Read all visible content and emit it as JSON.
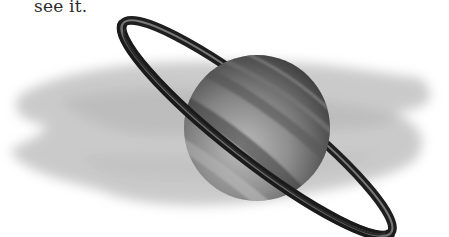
{
  "document": {
    "text_fragment": "see it."
  },
  "illustration": {
    "subject": "Saturn with rings",
    "style": "grayscale",
    "colors": {
      "background_smudge": "#b8b8b8",
      "planet_light": "#c9c9c9",
      "planet_dark": "#4a4a4a",
      "ring_dark": "#1e1e1e",
      "ring_mid": "#6e6e6e"
    }
  }
}
